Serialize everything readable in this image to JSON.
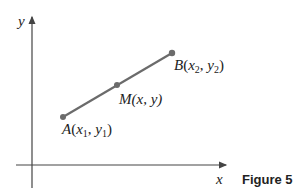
{
  "figure": {
    "caption": "Figure 5",
    "axes": {
      "x_label": "x",
      "y_label": "y"
    },
    "points": {
      "A": {
        "name": "A",
        "open": "(",
        "x": "x",
        "x_sub": "1",
        "comma": ", ",
        "y": "y",
        "y_sub": "1",
        "close": ")"
      },
      "M": {
        "name": "M",
        "coords": "(x, y)"
      },
      "B": {
        "name": "B",
        "open": "(",
        "x": "x",
        "x_sub": "2",
        "comma": ", ",
        "y": "y",
        "y_sub": "2",
        "close": ")"
      }
    },
    "colors": {
      "segment": "#6b6b6b",
      "axis": "#444444",
      "point": "#6b6b6b"
    }
  }
}
